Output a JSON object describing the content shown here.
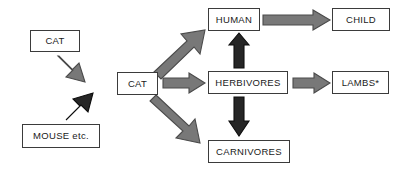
{
  "diagram": {
    "canvas": {
      "width": 405,
      "height": 172,
      "background": "#ffffff"
    },
    "colors": {
      "box_fill": "#ffffff",
      "box_border": "#3b3b3b",
      "text": "#1a1a1a",
      "arrow_gray_fill": "#787878",
      "arrow_gray_stroke": "#4a4a4a",
      "arrow_dark_fill": "#262626",
      "arrow_dark_stroke": "#0d0d0d"
    },
    "nodes": [
      {
        "id": "cat_source",
        "label": "CAT",
        "x": 30,
        "y": 30,
        "w": 50,
        "h": 22
      },
      {
        "id": "mouse_source",
        "label": "MOUSE etc.",
        "x": 22,
        "y": 124,
        "w": 78,
        "h": 24
      },
      {
        "id": "cat_center",
        "label": "CAT",
        "x": 117,
        "y": 72,
        "w": 41,
        "h": 23
      },
      {
        "id": "human",
        "label": "HUMAN",
        "x": 208,
        "y": 8,
        "w": 52,
        "h": 23
      },
      {
        "id": "child",
        "label": "CHILD",
        "x": 332,
        "y": 8,
        "w": 58,
        "h": 23
      },
      {
        "id": "herbivores",
        "label": "HERBIVORES",
        "x": 208,
        "y": 71,
        "w": 80,
        "h": 23
      },
      {
        "id": "lambs",
        "label": "LAMBS*",
        "x": 332,
        "y": 71,
        "w": 57,
        "h": 23
      },
      {
        "id": "carnivores",
        "label": "CARNIVORES",
        "x": 208,
        "y": 140,
        "w": 82,
        "h": 23
      }
    ],
    "arrows": [
      {
        "id": "cat-to-catcenter",
        "from": "cat_source",
        "to": "cat_center",
        "style": "gray",
        "direction": "down-right"
      },
      {
        "id": "mouse-to-catcenter",
        "from": "mouse_source",
        "to": "cat_center",
        "style": "dark",
        "direction": "up-right"
      },
      {
        "id": "catcenter-to-human",
        "from": "cat_center",
        "to": "human",
        "style": "gray",
        "direction": "up-right"
      },
      {
        "id": "catcenter-to-herbivores",
        "from": "cat_center",
        "to": "herbivores",
        "style": "gray",
        "direction": "right"
      },
      {
        "id": "catcenter-to-carnivores",
        "from": "cat_center",
        "to": "carnivores",
        "style": "gray",
        "direction": "down-right"
      },
      {
        "id": "human-to-child",
        "from": "human",
        "to": "child",
        "style": "gray",
        "direction": "right"
      },
      {
        "id": "herbivores-to-human",
        "from": "herbivores",
        "to": "human",
        "style": "dark",
        "direction": "up"
      },
      {
        "id": "herbivores-to-lambs",
        "from": "herbivores",
        "to": "lambs",
        "style": "gray",
        "direction": "right"
      },
      {
        "id": "herbivores-to-carnivores",
        "from": "herbivores",
        "to": "carnivores",
        "style": "dark",
        "direction": "down"
      }
    ]
  }
}
